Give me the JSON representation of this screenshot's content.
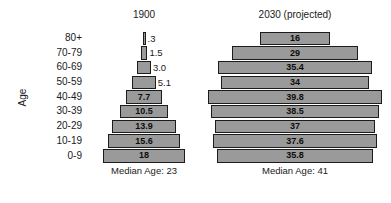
{
  "axis": {
    "title": "Age",
    "categories": [
      "80+",
      "70-79",
      "60-69",
      "50-59",
      "40-49",
      "30-39",
      "20-29",
      "10-19",
      "0-9"
    ]
  },
  "columns": [
    {
      "key": "c1900",
      "title": "1900",
      "median_label": "Median Age: 23",
      "values": [
        ".3",
        "1.5",
        "3.0",
        "5.1",
        "7.7",
        "10.5",
        "13.9",
        "15.6",
        "18"
      ]
    },
    {
      "key": "c2030",
      "title": "2030 (projected)",
      "median_label": "Median Age: 41",
      "values": [
        "16",
        "29",
        "35.4",
        "34",
        "39.8",
        "38.5",
        "37",
        "37.6",
        "35.8"
      ]
    }
  ],
  "colors": {
    "bar_fill": "#9a9a9a",
    "bar_border": "#1c1c1c",
    "text": "#1a1a1a",
    "background": "#ffffff"
  },
  "chart_data": {
    "type": "bar",
    "title": "",
    "subtitle": "",
    "orientation": "horizontal-centered-population-pyramid",
    "xlabel": "",
    "ylabel": "Age",
    "categories": [
      "80+",
      "70-79",
      "60-69",
      "50-59",
      "40-49",
      "30-39",
      "20-29",
      "10-19",
      "0-9"
    ],
    "series": [
      {
        "name": "1900",
        "values": [
          0.3,
          1.5,
          3.0,
          5.1,
          7.7,
          10.5,
          13.9,
          15.6,
          18
        ],
        "data_labels": [
          ".3",
          "1.5",
          "3.0",
          "5.1",
          "7.7",
          "10.5",
          "13.9",
          "15.6",
          "18"
        ],
        "annotation": "Median Age: 23"
      },
      {
        "name": "2030 (projected)",
        "values": [
          16,
          29,
          35.4,
          34,
          39.8,
          38.5,
          37,
          37.6,
          35.8
        ],
        "data_labels": [
          "16",
          "29",
          "35.4",
          "34",
          "39.8",
          "38.5",
          "37",
          "37.6",
          "35.8"
        ],
        "annotation": "Median Age: 41"
      }
    ],
    "grid": false,
    "legend": "none",
    "xlim": [
      0,
      40
    ]
  },
  "scale": {
    "px_per_unit_1900": 4.6,
    "px_per_unit_2030": 4.35,
    "min_bar_px": 3
  }
}
